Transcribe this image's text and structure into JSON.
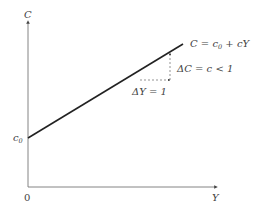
{
  "diagram": {
    "axes": {
      "y_label": "C",
      "x_label": "Y",
      "origin_label": "0",
      "intercept_label_base": "c",
      "intercept_label_sub": "0"
    },
    "line": {
      "equation_parts": {
        "lhs": "C",
        "eq": " = ",
        "c": "c",
        "sub": "0",
        "plus": " + ",
        "slope_term": "cY"
      }
    },
    "slope_triangle": {
      "delta_y_label": "ΔY = 1",
      "delta_c_label": "ΔC = c < 1"
    },
    "colors": {
      "axis": "#777777",
      "line": "#222222",
      "dashed": "#666666",
      "text": "#444444"
    }
  }
}
